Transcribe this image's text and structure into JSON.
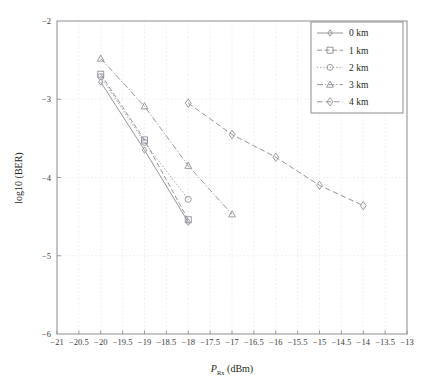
{
  "chart_data": {
    "type": "line",
    "title": "",
    "xlabel": "P_Rx (dBm)",
    "xlabel_main": "P",
    "xlabel_sub": "Rx",
    "xlabel_unit": " (dBm)",
    "ylabel": "log10 (BER)",
    "xlim": [
      -21,
      -13
    ],
    "ylim": [
      -6,
      -2
    ],
    "xticks": [
      -21,
      -20.5,
      -20,
      -19.5,
      -19,
      -18.5,
      -18,
      -17.5,
      -17,
      -16.5,
      -16,
      -15.5,
      -15,
      -14.5,
      -14,
      -13.5,
      -13
    ],
    "xtick_labels": [
      "−21",
      "−20.5",
      "−20",
      "−19.5",
      "−19",
      "−18.5",
      "−18",
      "−17.5",
      "−17",
      "−16.5",
      "−16",
      "−15.5",
      "−15",
      "−14.5",
      "−14",
      "−13.5",
      "−13"
    ],
    "yticks": [
      -2,
      -3,
      -4,
      -5,
      -6
    ],
    "ytick_labels": [
      "−2",
      "−3",
      "−4",
      "−5",
      "−6"
    ],
    "grid": true,
    "grid_color": "#e9e9ec",
    "legend_position": "top-right",
    "line_color": "#8f8f97",
    "series": [
      {
        "name": "0 km",
        "marker": "diamond-small",
        "dash": "solid",
        "x": [
          -20,
          -19,
          -18
        ],
        "y": [
          -2.78,
          -3.65,
          -4.57
        ]
      },
      {
        "name": "1 km",
        "marker": "square",
        "dash": "dashed",
        "x": [
          -20,
          -19,
          -18
        ],
        "y": [
          -2.68,
          -3.52,
          -4.54
        ]
      },
      {
        "name": "2 km",
        "marker": "circle",
        "dash": "dotted",
        "x": [
          -20,
          -19,
          -18
        ],
        "y": [
          -2.71,
          -3.55,
          -4.28
        ]
      },
      {
        "name": "3 km",
        "marker": "triangle",
        "dash": "dashdot",
        "x": [
          -20,
          -19,
          -18,
          -17
        ],
        "y": [
          -2.48,
          -3.09,
          -3.85,
          -4.47
        ]
      },
      {
        "name": "4 km",
        "marker": "diamond",
        "dash": "dashed-long",
        "x": [
          -18,
          -17,
          -16,
          -15,
          -14
        ],
        "y": [
          -3.05,
          -3.45,
          -3.74,
          -4.1,
          -4.36
        ]
      }
    ]
  },
  "legend": {
    "items": [
      {
        "label": "0 km"
      },
      {
        "label": "1 km"
      },
      {
        "label": "2 km"
      },
      {
        "label": "3 km"
      },
      {
        "label": "4 km"
      }
    ]
  }
}
